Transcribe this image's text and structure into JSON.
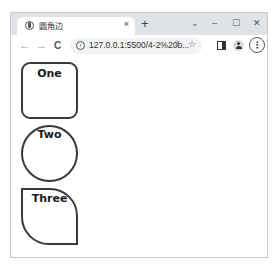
{
  "browser": {
    "tab": {
      "title": "圆角边",
      "close_icon": "×",
      "favicon": "globe-icon"
    },
    "new_tab_icon": "+",
    "window_controls": {
      "tab_search": "⌄",
      "minimize": "–",
      "maximize": "☐",
      "close": "✕"
    },
    "toolbar": {
      "back": "←",
      "forward": "→",
      "reload": "C",
      "info_icon": "i",
      "url": "127.0.0.1:5500/4-2%20b...",
      "share_icon": "⇪",
      "bookmark_icon": "☆",
      "menu_icon": "⋮"
    }
  },
  "page": {
    "shapes": [
      {
        "label": "One",
        "style": "rounded-rectangle"
      },
      {
        "label": "Two",
        "style": "circle"
      },
      {
        "label": "Three",
        "style": "leaf"
      }
    ],
    "border_color": "#3a3a3a"
  }
}
